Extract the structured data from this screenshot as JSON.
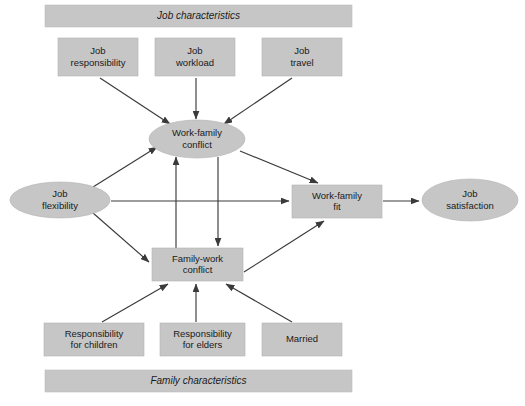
{
  "diagram": {
    "canvas": {
      "width": 525,
      "height": 406,
      "background": "#ffffff"
    },
    "colors": {
      "node_fill": "#c6c6c6",
      "node_stroke": "#b3b3b3",
      "edge": "#3a3a3a",
      "text": "#1a1a1a"
    },
    "banners": {
      "top": {
        "label": "Job characteristics",
        "x": 45,
        "y": 5,
        "w": 307,
        "h": 22
      },
      "bottom": {
        "label": "Family characteristics",
        "x": 45,
        "y": 370,
        "w": 307,
        "h": 22
      }
    },
    "nodes": [
      {
        "id": "job-responsibility",
        "shape": "rect",
        "line1": "Job",
        "line2": "responsibility",
        "x": 58,
        "y": 38,
        "w": 80,
        "h": 38
      },
      {
        "id": "job-workload",
        "shape": "rect",
        "line1": "Job",
        "line2": "workload",
        "x": 155,
        "y": 38,
        "w": 80,
        "h": 38
      },
      {
        "id": "job-travel",
        "shape": "rect",
        "line1": "Job",
        "line2": "travel",
        "x": 262,
        "y": 38,
        "w": 80,
        "h": 38
      },
      {
        "id": "work-family-conflict",
        "shape": "ellipse",
        "line1": "Work-family",
        "line2": "conflict",
        "cx": 197,
        "cy": 139,
        "rx": 48,
        "ry": 19
      },
      {
        "id": "job-flexibility",
        "shape": "ellipse",
        "line1": "Job",
        "line2": "flexibility",
        "cx": 60,
        "cy": 200,
        "rx": 50,
        "ry": 18
      },
      {
        "id": "work-family-fit",
        "shape": "rect",
        "line1": "Work-family",
        "line2": "fit",
        "x": 292,
        "y": 185,
        "w": 90,
        "h": 33
      },
      {
        "id": "job-satisfaction",
        "shape": "ellipse",
        "line1": "Job",
        "line2": "satisfaction",
        "cx": 470,
        "cy": 200,
        "rx": 48,
        "ry": 21
      },
      {
        "id": "family-work-conflict",
        "shape": "rect",
        "line1": "Family-work",
        "line2": "conflict",
        "x": 152,
        "y": 248,
        "w": 91,
        "h": 33
      },
      {
        "id": "responsibility-for-children",
        "shape": "rect",
        "line1": "Responsibility",
        "line2": "for children",
        "x": 44,
        "y": 323,
        "w": 100,
        "h": 33
      },
      {
        "id": "responsibility-for-elders",
        "shape": "rect",
        "line1": "Responsibility",
        "line2": "for elders",
        "x": 160,
        "y": 323,
        "w": 85,
        "h": 33
      },
      {
        "id": "married",
        "shape": "rect",
        "line1": "Married",
        "line2": "",
        "x": 262,
        "y": 323,
        "w": 80,
        "h": 33
      }
    ],
    "edges": [
      {
        "id": "job-responsibility-to-work-family-conflict",
        "from": "job-responsibility",
        "to": "work-family-conflict",
        "x1": 100,
        "y1": 78,
        "x2": 170,
        "y2": 124
      },
      {
        "id": "job-workload-to-work-family-conflict",
        "from": "job-workload",
        "to": "work-family-conflict",
        "x1": 196,
        "y1": 78,
        "x2": 196,
        "y2": 119
      },
      {
        "id": "job-travel-to-work-family-conflict",
        "from": "job-travel",
        "to": "work-family-conflict",
        "x1": 292,
        "y1": 78,
        "x2": 224,
        "y2": 124
      },
      {
        "id": "job-flexibility-to-work-family-conflict",
        "from": "job-flexibility",
        "to": "work-family-conflict",
        "x1": 93,
        "y1": 187,
        "x2": 157,
        "y2": 147
      },
      {
        "id": "job-flexibility-to-family-work-conflict",
        "from": "job-flexibility",
        "to": "family-work-conflict",
        "x1": 93,
        "y1": 213,
        "x2": 149,
        "y2": 262
      },
      {
        "id": "job-flexibility-to-work-family-fit",
        "from": "job-flexibility",
        "to": "work-family-fit",
        "x1": 111,
        "y1": 201,
        "x2": 289,
        "y2": 201
      },
      {
        "id": "family-work-conflict-to-work-family-conflict",
        "from": "family-work-conflict",
        "to": "work-family-conflict",
        "x1": 176,
        "y1": 248,
        "x2": 176,
        "y2": 157
      },
      {
        "id": "work-family-conflict-to-family-work-conflict",
        "from": "work-family-conflict",
        "to": "family-work-conflict",
        "x1": 218,
        "y1": 157,
        "x2": 218,
        "y2": 246
      },
      {
        "id": "work-family-conflict-to-work-family-fit",
        "from": "work-family-conflict",
        "to": "work-family-fit",
        "x1": 240,
        "y1": 151,
        "x2": 318,
        "y2": 183
      },
      {
        "id": "family-work-conflict-to-work-family-fit",
        "from": "family-work-conflict",
        "to": "work-family-fit",
        "x1": 244,
        "y1": 272,
        "x2": 324,
        "y2": 221
      },
      {
        "id": "work-family-fit-to-job-satisfaction",
        "from": "work-family-fit",
        "to": "job-satisfaction",
        "x1": 383,
        "y1": 201,
        "x2": 419,
        "y2": 201
      },
      {
        "id": "responsibility-for-children-to-family-work-conflict",
        "from": "responsibility-for-children",
        "to": "family-work-conflict",
        "x1": 102,
        "y1": 322,
        "x2": 168,
        "y2": 284
      },
      {
        "id": "responsibility-for-elders-to-family-work-conflict",
        "from": "responsibility-for-elders",
        "to": "family-work-conflict",
        "x1": 196,
        "y1": 322,
        "x2": 196,
        "y2": 284
      },
      {
        "id": "married-to-family-work-conflict",
        "from": "married",
        "to": "family-work-conflict",
        "x1": 292,
        "y1": 322,
        "x2": 226,
        "y2": 284
      }
    ]
  }
}
